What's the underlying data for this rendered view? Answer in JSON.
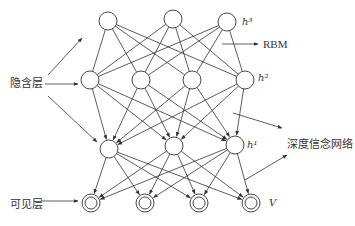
{
  "diagram": {
    "type": "deep belief network",
    "layers": [
      {
        "id": "h3",
        "label": "h³",
        "nodes": [
          [
            108,
            21
          ],
          [
            173,
            19
          ],
          [
            227,
            22
          ]
        ],
        "style": "circle"
      },
      {
        "id": "h2",
        "label": "h²",
        "nodes": [
          [
            90,
            80
          ],
          [
            141,
            80
          ],
          [
            192,
            80
          ],
          [
            245,
            80
          ]
        ],
        "style": "circle"
      },
      {
        "id": "h1",
        "label": "h¹",
        "nodes": [
          [
            109,
            149
          ],
          [
            174,
            146
          ],
          [
            235,
            145
          ]
        ],
        "style": "circle"
      },
      {
        "id": "v",
        "label": "V",
        "nodes": [
          [
            91,
            203
          ],
          [
            145,
            203
          ],
          [
            199,
            203
          ],
          [
            251,
            203
          ]
        ],
        "style": "double-circle"
      }
    ],
    "labels": {
      "hidden_layer": "隐含层",
      "visible_layer": "可见层",
      "rbm": "RBM",
      "dbn": "深度信念网络",
      "h3": "h³",
      "h2": "h²",
      "h1": "h¹",
      "v": "V"
    },
    "colors": {
      "stroke": "#333333",
      "background": "#ffffff"
    }
  }
}
